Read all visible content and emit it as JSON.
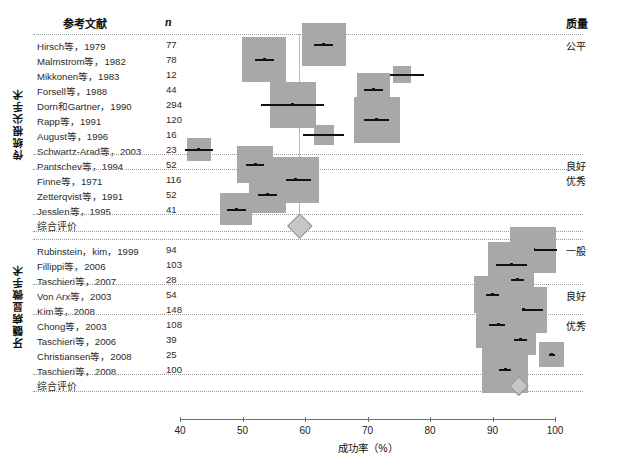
{
  "header": {
    "reference_label": "参考文献",
    "n_label": "n",
    "quality_label": "质量"
  },
  "groups": [
    {
      "label": "传统根尖手术"
    },
    {
      "label": "牙髓病显微手术"
    }
  ],
  "summary_label_top": "综合评价",
  "summary_label_bottom": "综合评价",
  "axis": {
    "title": "成功率（%）",
    "ticks": [
      "40",
      "50",
      "60",
      "70",
      "80",
      "90",
      "100"
    ],
    "min": 40,
    "max": 100
  },
  "colors": {
    "box": "#a8a8a8",
    "marker": "#111111",
    "refline": "#b9b9b9",
    "diamond": "#c6c6c6",
    "separator": "#9a9a9a",
    "axis": "#6e6e6e"
  },
  "chart_data": {
    "type": "forest",
    "title": "",
    "xlabel": "成功率（%）",
    "ylabel": "",
    "xlim": [
      40,
      100
    ],
    "grid": false,
    "legend": "none",
    "columns": [
      "参考文献",
      "n",
      "成功率（%）",
      "质量"
    ],
    "groups": [
      {
        "name": "传统根尖手术",
        "pooled": {
          "label": "综合评价",
          "estimate": 59.0,
          "ci_low": 57.0,
          "ci_high": 61.0
        },
        "reference_value": 59.0,
        "studies": [
          {
            "study": "Hirsch等，1979",
            "n": "77",
            "estimate": 63.0,
            "ci_low": 61.5,
            "ci_high": 64.5,
            "quality": "公平"
          },
          {
            "study": "Malmstrom等，1982",
            "n": "78",
            "estimate": 53.5,
            "ci_low": 52.0,
            "ci_high": 55.0,
            "quality": ""
          },
          {
            "study": "Mikkonen等，1983",
            "n": "12",
            "estimate": 75.5,
            "ci_low": 72.0,
            "ci_high": 79.0,
            "quality": ""
          },
          {
            "study": "Forsell等，1988",
            "n": "44",
            "estimate": 71.0,
            "ci_low": 69.5,
            "ci_high": 72.5,
            "quality": ""
          },
          {
            "study": "Dorn和Gartner，1990",
            "n": "294",
            "estimate": 58.0,
            "ci_low": 53.0,
            "ci_high": 63.0,
            "quality": ""
          },
          {
            "study": "Rapp等，1991",
            "n": "120",
            "estimate": 71.5,
            "ci_low": 69.5,
            "ci_high": 73.5,
            "quality": ""
          },
          {
            "study": "August等，1996",
            "n": "16",
            "estimate": 63.0,
            "ci_low": 60.0,
            "ci_high": 66.5,
            "quality": ""
          },
          {
            "study": "Schwartz-Arad等，2003",
            "n": "23",
            "estimate": 43.0,
            "ci_low": 41.0,
            "ci_high": 45.5,
            "quality": ""
          },
          {
            "study": "Pantschev等，1994",
            "n": "52",
            "estimate": 52.0,
            "ci_low": 50.5,
            "ci_high": 53.5,
            "quality": "良好"
          },
          {
            "study": "Finne等，1971",
            "n": "116",
            "estimate": 58.5,
            "ci_low": 56.0,
            "ci_high": 61.0,
            "quality": "优秀"
          },
          {
            "study": "Zetterqvist等，1991",
            "n": "52",
            "estimate": 54.0,
            "ci_low": 52.5,
            "ci_high": 55.5,
            "quality": ""
          },
          {
            "study": "Jesslen等，1995",
            "n": "41",
            "estimate": 49.0,
            "ci_low": 47.5,
            "ci_high": 50.5,
            "quality": ""
          }
        ]
      },
      {
        "name": "牙髓病显微手术",
        "pooled": {
          "label": "综合评价",
          "estimate": 94.0,
          "ci_low": 92.5,
          "ci_high": 95.5
        },
        "reference_value": 94.0,
        "studies": [
          {
            "study": "Rubinstein，kim，1999",
            "n": "94",
            "estimate": 96.5,
            "ci_low": 92.5,
            "ci_high": 100.0,
            "quality": "一般"
          },
          {
            "study": "Fillippi等，2006",
            "n": "103",
            "estimate": 93.0,
            "ci_low": 90.5,
            "ci_high": 95.5,
            "quality": ""
          },
          {
            "study": "Taschieri等，2007",
            "n": "28",
            "estimate": 94.0,
            "ci_low": 93.0,
            "ci_high": 95.0,
            "quality": ""
          },
          {
            "study": "Von Arx等，2003",
            "n": "54",
            "estimate": 90.0,
            "ci_low": 89.0,
            "ci_high": 91.0,
            "quality": "良好"
          },
          {
            "study": "Kim等，2008",
            "n": "148",
            "estimate": 95.0,
            "ci_low": 92.0,
            "ci_high": 98.0,
            "quality": ""
          },
          {
            "study": "Chong等，2003",
            "n": "108",
            "estimate": 91.0,
            "ci_low": 89.5,
            "ci_high": 92.5,
            "quality": "优秀"
          },
          {
            "study": "Taschieri等，2006",
            "n": "39",
            "estimate": 94.5,
            "ci_low": 93.5,
            "ci_high": 95.5,
            "quality": ""
          },
          {
            "study": "Christiansen等，2008",
            "n": "25",
            "estimate": 99.5,
            "ci_low": 99.0,
            "ci_high": 100.0,
            "quality": ""
          },
          {
            "study": "Taschieri等，2008",
            "n": "100",
            "estimate": 92.0,
            "ci_low": 91.0,
            "ci_high": 93.0,
            "quality": ""
          }
        ]
      }
    ]
  }
}
